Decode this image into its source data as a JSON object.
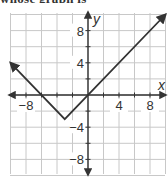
{
  "header": {
    "cut_title": "whose graph is"
  },
  "chart_data": {
    "type": "line",
    "title": "",
    "xlabel": "x",
    "ylabel": "y",
    "xlim": [
      -10,
      10
    ],
    "ylim": [
      -10,
      10
    ],
    "grid": true,
    "grid_step": 2,
    "x_ticks": [
      {
        "value": -8,
        "label": "−8"
      },
      {
        "value": 4,
        "label": "4"
      },
      {
        "value": 8,
        "label": "8"
      }
    ],
    "y_ticks": [
      {
        "value": 8,
        "label": "8"
      },
      {
        "value": 4,
        "label": "4"
      },
      {
        "value": -4,
        "label": "−4"
      },
      {
        "value": -8,
        "label": "−8"
      }
    ],
    "series": [
      {
        "name": "y = |x + 3| − 3",
        "x": [
          -10,
          -3,
          10
        ],
        "y": [
          4,
          -3,
          10
        ],
        "arrows": "both"
      }
    ],
    "colors": {
      "grid": "#c8c8c8",
      "axis": "#333333",
      "line": "#333333"
    }
  }
}
